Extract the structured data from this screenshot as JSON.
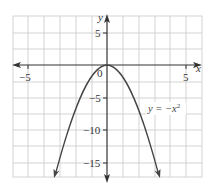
{
  "chart_data": {
    "type": "line",
    "title": "",
    "xlabel": "x",
    "ylabel": "y",
    "xlim": [
      -6,
      6
    ],
    "ylim": [
      -17,
      7.5
    ],
    "grid": true,
    "x_ticks": [
      -5,
      0,
      5
    ],
    "x_tick_labels": [
      "−5",
      "0",
      "5"
    ],
    "y_ticks": [
      5,
      -5,
      -10,
      -15
    ],
    "y_tick_labels": [
      "5",
      "−5",
      "−10",
      "−15"
    ],
    "origin_label": "0",
    "series": [
      {
        "name": "y = −x²",
        "equation": "y = -x^2",
        "x": [
          -4,
          -3,
          -2,
          -1,
          0,
          1,
          2,
          3,
          4
        ],
        "y": [
          -16,
          -9,
          -4,
          -1,
          0,
          -1,
          -4,
          -9,
          -16
        ],
        "arrows_at_ends": true,
        "color": "#444444"
      }
    ],
    "annotations": [
      {
        "text_prefix": "y = −x",
        "superscript": "2",
        "position": "right of curve, near y = −5"
      }
    ],
    "colors": {
      "grid": "#c8c8c8",
      "axis": "#333333",
      "curve": "#444444",
      "background": "#ffffff"
    }
  }
}
